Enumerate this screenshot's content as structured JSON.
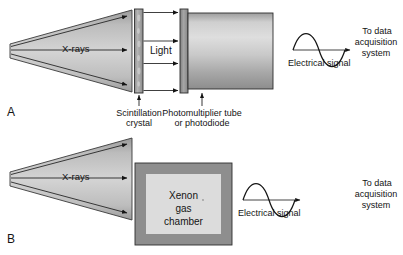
{
  "figure": {
    "panels": [
      {
        "letter": "A",
        "beam_label": "X-rays",
        "middle_label": "Light",
        "signal_label": "Electrical signal",
        "destination_lines": [
          "To data",
          "acquisition",
          "system"
        ],
        "callouts": [
          {
            "lines": [
              "Scintillation",
              "crystal"
            ]
          },
          {
            "lines": [
              "Photomultiplier tube",
              "or photodiode"
            ]
          }
        ]
      },
      {
        "letter": "B",
        "beam_label": "X-rays",
        "box_lines": [
          "Xenon",
          "gas",
          "chamber"
        ],
        "signal_label": "Electrical signal",
        "destination_lines": [
          "To data",
          "acquisition",
          "system"
        ]
      }
    ]
  },
  "colors": {
    "ink": "#141414",
    "beam_light": "#d6d6d6",
    "beam_dark": "#8f8f8f",
    "crystal_fill": "#a3a3a3",
    "pmt_face": "#8c8c8c",
    "pmt_light": "#d8d8d8",
    "pmt_dark": "#8a8a8a",
    "chamber_border": "#8e8e8e",
    "chamber_fill": "#dcdcdc",
    "background": "#ffffff"
  }
}
